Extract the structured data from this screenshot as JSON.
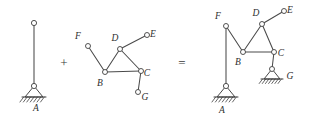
{
  "figure": {
    "width": 309,
    "height": 119,
    "background_color": "#ffffff",
    "line_color": "#4a4a4a",
    "label_color": "#2e2e2e",
    "joint_fill": "#ffffff"
  },
  "operators": {
    "plus": "+",
    "equals": "="
  },
  "panels": [
    {
      "id": "left",
      "name": "vertical-member-panel",
      "labels": [
        {
          "text": "A",
          "x": 36,
          "y": 111
        }
      ],
      "joints": [
        {
          "name": "top-pin",
          "x": 34,
          "y": 23,
          "r": 2.6
        },
        {
          "name": "support-pin-A",
          "x": 34,
          "y": 86,
          "r": 2.6
        }
      ],
      "members": [
        {
          "name": "member-vertical",
          "x1": 34,
          "y1": 23,
          "x2": 34,
          "y2": 86
        }
      ],
      "supports": [
        {
          "name": "pinned-support-A",
          "apex_x": 34,
          "apex_y": 86,
          "half_width": 9,
          "height": 11,
          "ground_x1": 22,
          "ground_x2": 46,
          "ground_y": 97,
          "hatch_count": 6,
          "hatch_len": 5,
          "rotation": 0
        }
      ]
    },
    {
      "id": "middle",
      "name": "frame-assembly-panel",
      "labels": [
        {
          "text": "F",
          "x": 78,
          "y": 39
        },
        {
          "text": "D",
          "x": 115,
          "y": 41
        },
        {
          "text": "E",
          "x": 153,
          "y": 37
        },
        {
          "text": "B",
          "x": 100,
          "y": 86
        },
        {
          "text": "C",
          "x": 147,
          "y": 76
        },
        {
          "text": "G",
          "x": 145,
          "y": 100
        }
      ],
      "joints": [
        {
          "name": "joint-F",
          "x": 88,
          "y": 46,
          "r": 2.5
        },
        {
          "name": "joint-D",
          "x": 120,
          "y": 49,
          "r": 2.5
        },
        {
          "name": "joint-E",
          "x": 147,
          "y": 35,
          "r": 2.5
        },
        {
          "name": "joint-B",
          "x": 105,
          "y": 72,
          "r": 2.5
        },
        {
          "name": "joint-C",
          "x": 141,
          "y": 71,
          "r": 2.5
        },
        {
          "name": "joint-G",
          "x": 138,
          "y": 92,
          "r": 2.5
        }
      ],
      "members": [
        {
          "name": "member-F-B",
          "x1": 88,
          "y1": 46,
          "x2": 105,
          "y2": 72
        },
        {
          "name": "member-B-D",
          "x1": 105,
          "y1": 72,
          "x2": 120,
          "y2": 49
        },
        {
          "name": "member-D-C",
          "x1": 120,
          "y1": 49,
          "x2": 141,
          "y2": 71
        },
        {
          "name": "member-B-C",
          "x1": 105,
          "y1": 72,
          "x2": 141,
          "y2": 71
        },
        {
          "name": "member-D-E",
          "x1": 120,
          "y1": 49,
          "x2": 147,
          "y2": 35
        },
        {
          "name": "member-C-G",
          "x1": 141,
          "y1": 71,
          "x2": 138,
          "y2": 92
        }
      ],
      "supports": []
    },
    {
      "id": "right",
      "name": "combined-structure-panel",
      "labels": [
        {
          "text": "F",
          "x": 218,
          "y": 19
        },
        {
          "text": "D",
          "x": 256,
          "y": 16
        },
        {
          "text": "E",
          "x": 290,
          "y": 13
        },
        {
          "text": "B",
          "x": 238,
          "y": 65
        },
        {
          "text": "C",
          "x": 281,
          "y": 56
        },
        {
          "text": "G",
          "x": 290,
          "y": 79
        },
        {
          "text": "A",
          "x": 222,
          "y": 113
        }
      ],
      "joints": [
        {
          "name": "joint-F",
          "x": 226,
          "y": 26,
          "r": 2.5
        },
        {
          "name": "joint-D",
          "x": 262,
          "y": 24,
          "r": 2.5
        },
        {
          "name": "joint-E",
          "x": 284,
          "y": 11,
          "r": 2.5
        },
        {
          "name": "joint-B",
          "x": 243,
          "y": 52,
          "r": 2.5
        },
        {
          "name": "joint-C",
          "x": 274,
          "y": 52,
          "r": 2.5
        },
        {
          "name": "support-pin-G",
          "x": 272,
          "y": 69,
          "r": 2.5
        },
        {
          "name": "support-pin-A",
          "x": 226,
          "y": 86,
          "r": 2.6
        }
      ],
      "members": [
        {
          "name": "member-A-F",
          "x1": 226,
          "y1": 26,
          "x2": 226,
          "y2": 86
        },
        {
          "name": "member-F-B",
          "x1": 226,
          "y1": 26,
          "x2": 243,
          "y2": 52
        },
        {
          "name": "member-B-D",
          "x1": 243,
          "y1": 52,
          "x2": 262,
          "y2": 24
        },
        {
          "name": "member-D-C",
          "x1": 262,
          "y1": 24,
          "x2": 274,
          "y2": 52
        },
        {
          "name": "member-B-C",
          "x1": 243,
          "y1": 52,
          "x2": 274,
          "y2": 52
        },
        {
          "name": "member-D-E",
          "x1": 262,
          "y1": 24,
          "x2": 284,
          "y2": 11
        },
        {
          "name": "member-C-G",
          "x1": 274,
          "y1": 52,
          "x2": 272,
          "y2": 69
        }
      ],
      "supports": [
        {
          "name": "pinned-support-A",
          "apex_x": 226,
          "apex_y": 86,
          "half_width": 9,
          "height": 11,
          "ground_x1": 214,
          "ground_x2": 238,
          "ground_y": 97,
          "hatch_count": 6,
          "hatch_len": 5,
          "rotation": 0
        },
        {
          "name": "pinned-support-G",
          "apex_x": 272,
          "apex_y": 69,
          "half_width": 8,
          "height": 10,
          "ground_x1": 261,
          "ground_x2": 283,
          "ground_y": 79,
          "hatch_count": 6,
          "hatch_len": 4.5,
          "rotation": 0
        }
      ]
    }
  ],
  "operator_positions": [
    {
      "name": "plus-operator",
      "symbol_key": "plus",
      "x": 64,
      "y": 67
    },
    {
      "name": "equals-operator",
      "symbol_key": "equals",
      "x": 182,
      "y": 67
    }
  ]
}
